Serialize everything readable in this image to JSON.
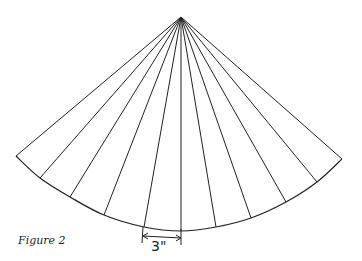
{
  "figure": {
    "caption": "Figure 2",
    "dimension_label": "3\"",
    "colors": {
      "stroke": "#222222",
      "background": "#ffffff"
    }
  },
  "geometry": {
    "apex": [
      181,
      17
    ],
    "arc_points": [
      [
        16,
        156
      ],
      [
        40,
        178
      ],
      [
        70,
        197
      ],
      [
        104,
        215
      ],
      [
        144,
        227
      ],
      [
        181,
        231
      ],
      [
        216,
        227
      ],
      [
        251,
        218
      ],
      [
        286,
        202
      ],
      [
        317,
        182
      ],
      [
        342,
        159
      ]
    ],
    "dimension": {
      "x1": 143,
      "x2": 181,
      "y": 237,
      "label_x": 151,
      "label_y": 251
    }
  }
}
